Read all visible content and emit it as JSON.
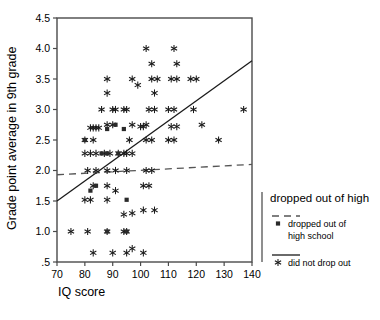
{
  "chart_data": {
    "type": "scatter",
    "title": "",
    "xlabel": "IQ score",
    "ylabel": "Grade point average in 9th grade",
    "xlim": [
      70,
      140
    ],
    "ylim": [
      0.5,
      4.5
    ],
    "xticks": [
      "70",
      "80",
      "90",
      "100",
      "110",
      "120",
      "130",
      "140"
    ],
    "xtick_values": [
      70,
      80,
      90,
      100,
      110,
      120,
      130,
      140
    ],
    "yticks": [
      "4.5",
      "4.0",
      "3.5",
      "3.0",
      "2.5",
      "2.0",
      "1.5",
      "1.0",
      ".5"
    ],
    "ytick_values": [
      4.5,
      4.0,
      3.5,
      3.0,
      2.5,
      2.0,
      1.5,
      1.0,
      0.5
    ],
    "grid": false,
    "legend_position": "right",
    "legend": {
      "title": "dropped out of high",
      "entries": [
        {
          "marker": "square",
          "line": "dashed",
          "label": "dropped out of high school"
        },
        {
          "marker": "star",
          "line": "solid",
          "label": "did not drop out"
        }
      ]
    },
    "series": [
      {
        "name": "did not drop out",
        "marker": "star",
        "fit_line": "solid",
        "fit_line_endpoints": [
          [
            70,
            1.5
          ],
          [
            140,
            3.8
          ]
        ],
        "points": [
          [
            82,
            2.7
          ],
          [
            83,
            2.7
          ],
          [
            84,
            2.7
          ],
          [
            85,
            2.7
          ],
          [
            80,
            2.5
          ],
          [
            83,
            2.5
          ],
          [
            80,
            2.28
          ],
          [
            82,
            2.28
          ],
          [
            84,
            2.28
          ],
          [
            81,
            2.0
          ],
          [
            84,
            2.0
          ],
          [
            83,
            1.75
          ],
          [
            80,
            1.52
          ],
          [
            82,
            1.52
          ],
          [
            75,
            1.0
          ],
          [
            81,
            1.0
          ],
          [
            83,
            0.65
          ],
          [
            88,
            3.5
          ],
          [
            88,
            3.27
          ],
          [
            86,
            3.0
          ],
          [
            90,
            3.0
          ],
          [
            91,
            3.0
          ],
          [
            94,
            3.0
          ],
          [
            95,
            3.0
          ],
          [
            88,
            2.75
          ],
          [
            90,
            2.75
          ],
          [
            87,
            2.28
          ],
          [
            89,
            2.28
          ],
          [
            92,
            2.28
          ],
          [
            94,
            2.28
          ],
          [
            88,
            2.0
          ],
          [
            91,
            2.0
          ],
          [
            88,
            1.75
          ],
          [
            91,
            1.67
          ],
          [
            88,
            1.52
          ],
          [
            88,
            1.0
          ],
          [
            94,
            1.0
          ],
          [
            95,
            1.0
          ],
          [
            90,
            0.65
          ],
          [
            95,
            0.65
          ],
          [
            97,
            3.5
          ],
          [
            99,
            3.4
          ],
          [
            97,
            2.75
          ],
          [
            100,
            2.72
          ],
          [
            101,
            2.72
          ],
          [
            96,
            2.5
          ],
          [
            95,
            2.28
          ],
          [
            97,
            2.28
          ],
          [
            95,
            2.0
          ],
          [
            94,
            1.28
          ],
          [
            97,
            1.3
          ],
          [
            97,
            0.72
          ],
          [
            101,
            0.65
          ],
          [
            102,
            4.0
          ],
          [
            104,
            3.75
          ],
          [
            104,
            3.5
          ],
          [
            106,
            3.5
          ],
          [
            105,
            3.27
          ],
          [
            103,
            3.0
          ],
          [
            105,
            3.0
          ],
          [
            102,
            2.75
          ],
          [
            102,
            2.5
          ],
          [
            104,
            2.5
          ],
          [
            102,
            2.0
          ],
          [
            104,
            2.0
          ],
          [
            101,
            1.75
          ],
          [
            103,
            1.75
          ],
          [
            101,
            1.35
          ],
          [
            105,
            1.35
          ],
          [
            112,
            4.0
          ],
          [
            113,
            3.75
          ],
          [
            111,
            3.5
          ],
          [
            113,
            3.5
          ],
          [
            110,
            3.0
          ],
          [
            112,
            3.0
          ],
          [
            111,
            2.72
          ],
          [
            113,
            2.72
          ],
          [
            110,
            2.5
          ],
          [
            112,
            2.5
          ],
          [
            118,
            3.5
          ],
          [
            120,
            3.5
          ],
          [
            119,
            3.0
          ],
          [
            122,
            2.75
          ],
          [
            128,
            2.5
          ],
          [
            137,
            3.0
          ]
        ]
      },
      {
        "name": "dropped out of high school",
        "marker": "square",
        "fit_line": "dashed",
        "fit_line_endpoints": [
          [
            70,
            1.93
          ],
          [
            140,
            2.1
          ]
        ],
        "points": [
          [
            88,
            2.68
          ],
          [
            91,
            2.75
          ],
          [
            94,
            2.68
          ],
          [
            80,
            2.5
          ],
          [
            86,
            2.28
          ],
          [
            88,
            2.28
          ],
          [
            84,
            1.75
          ],
          [
            82,
            1.67
          ],
          [
            88,
            1.0
          ],
          [
            95,
            1.0
          ],
          [
            95,
            1.52
          ],
          [
            92,
            2.28
          ]
        ]
      }
    ]
  }
}
